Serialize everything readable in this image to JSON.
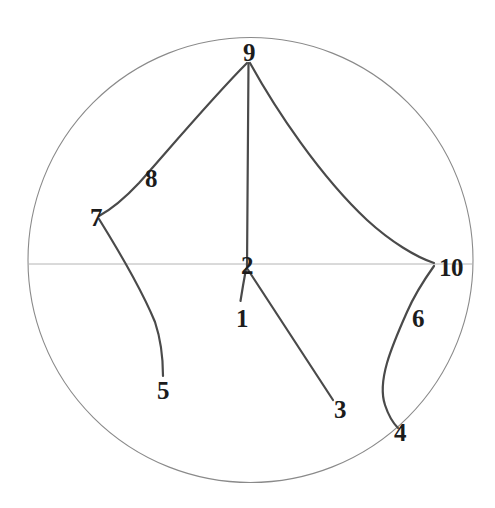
{
  "figure": {
    "kind": "hyperbolic-geodesic-disk",
    "background_color": "#ffffff",
    "boundary_color": "#8a8a8a",
    "axis_color": "#b4b4b4",
    "curve_color": "#4a4a4a",
    "label_color": "#1c1c1c",
    "disk": {
      "cx": 250.5,
      "cy": 260,
      "r": 222.5
    },
    "axis": {
      "y": 264,
      "x1": 28,
      "x2": 473
    },
    "labels": [
      {
        "id": "1",
        "text": "1",
        "x": 242,
        "y": 318
      },
      {
        "id": "2",
        "text": "2",
        "x": 247,
        "y": 265
      },
      {
        "id": "3",
        "text": "3",
        "x": 340,
        "y": 409
      },
      {
        "id": "4",
        "text": "4",
        "x": 400,
        "y": 432
      },
      {
        "id": "5",
        "text": "5",
        "x": 163,
        "y": 390
      },
      {
        "id": "6",
        "text": "6",
        "x": 418,
        "y": 318
      },
      {
        "id": "7",
        "text": "7",
        "x": 96,
        "y": 217
      },
      {
        "id": "8",
        "text": "8",
        "x": 151,
        "y": 178
      },
      {
        "id": "9",
        "text": "9",
        "x": 249,
        "y": 52
      },
      {
        "id": "10",
        "text": "10",
        "x": 451,
        "y": 267
      }
    ],
    "curves": [
      {
        "id": "edge-2-9",
        "from": "2",
        "to": "9",
        "path": "M 247 268 L 248.5 63"
      },
      {
        "id": "edge-2-3",
        "from": "2",
        "to": "3",
        "path": "M 247.5 269 L 333 400"
      },
      {
        "id": "edge-2-1",
        "from": "2",
        "to": "1",
        "path": "M 246 269 Q 243 285 240.5 301"
      },
      {
        "id": "edge-9-7",
        "from": "9",
        "to": "7",
        "path": "M 247 63 C 214 96 170 148 139 183 C 124 199 110 210 99 216"
      },
      {
        "id": "edge-9-10",
        "from": "9",
        "to": "10",
        "path": "M 250 63 C 276 110 320 176 367 220 C 391 242 416 257 434 263"
      },
      {
        "id": "edge-7-5",
        "from": "7",
        "to": "5",
        "path": "M 99 219 C 117 248 141 288 155 322 C 161 340 163 361 163 376"
      },
      {
        "id": "edge-10-4",
        "from": "10",
        "to": "4",
        "path": "M 434 266 C 424 280 414 296 407 312 C 391 348 377 381 385 405 C 389 417 394 424 398 428"
      }
    ]
  }
}
